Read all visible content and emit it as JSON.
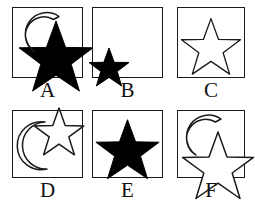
{
  "figure": {
    "type": "shape-matrix",
    "rows": 2,
    "columns": 3,
    "background_color": "#ffffff",
    "outline_color": "#1a1a1a",
    "fill_color": "#000000",
    "panels": [
      {
        "label": "A",
        "shapes": [
          {
            "shape": "crescent-moon",
            "fill": "outline",
            "position": "upper-left",
            "opening_direction": "lower-right",
            "size": "medium"
          },
          {
            "shape": "five-pointed-star",
            "fill": "solid-black",
            "position": "center-right",
            "size": "large",
            "overflows_border": true
          }
        ],
        "description": "Large solid black star overlapped by an outlined crescent moon at upper left"
      },
      {
        "label": "B",
        "shapes": [
          {
            "shape": "five-pointed-star",
            "fill": "solid-black",
            "position": "lower-left",
            "size": "small",
            "overflows_border": true
          }
        ],
        "description": "Small solid black star at the lower left corner of the box"
      },
      {
        "label": "C",
        "shapes": [
          {
            "shape": "five-pointed-star",
            "fill": "outline",
            "position": "center",
            "size": "large",
            "overflows_border": false
          }
        ],
        "description": "Single outlined star centered in the box"
      },
      {
        "label": "D",
        "shapes": [
          {
            "shape": "crescent-moon",
            "fill": "outline",
            "position": "lower-left",
            "opening_direction": "upper-right",
            "size": "large"
          },
          {
            "shape": "five-pointed-star",
            "fill": "outline",
            "position": "upper-right",
            "size": "medium",
            "overflows_border": true
          }
        ],
        "description": "Outlined crescent moon at lower left with an outlined star at upper right"
      },
      {
        "label": "E",
        "shapes": [
          {
            "shape": "five-pointed-star",
            "fill": "solid-black",
            "position": "center",
            "size": "large",
            "overflows_border": false
          }
        ],
        "description": "Single large solid black star centered in the box"
      },
      {
        "label": "F",
        "shapes": [
          {
            "shape": "crescent-moon",
            "fill": "outline",
            "position": "upper-left",
            "opening_direction": "lower-right",
            "size": "medium"
          },
          {
            "shape": "five-pointed-star",
            "fill": "outline",
            "position": "lower-right",
            "size": "large",
            "overflows_border": true
          }
        ],
        "description": "Outlined crescent moon at upper left overlapping a large outlined star at lower right"
      }
    ]
  }
}
